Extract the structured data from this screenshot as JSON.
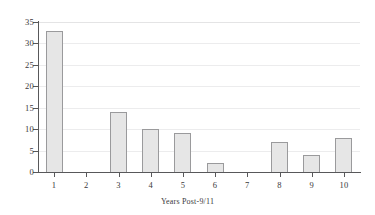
{
  "chart_data": {
    "type": "bar",
    "title": "",
    "subtitle": "",
    "xlabel": "Years Post-9/11",
    "ylabel": "",
    "categories": [
      "1",
      "2",
      "3",
      "4",
      "5",
      "6",
      "7",
      "8",
      "9",
      "10"
    ],
    "values": [
      33,
      0,
      14,
      10,
      9,
      2,
      0,
      7,
      4,
      8
    ],
    "series": [
      {
        "name": "count",
        "values": [
          33,
          0,
          14,
          10,
          9,
          2,
          0,
          7,
          4,
          8
        ]
      }
    ],
    "ylim": [
      0,
      35
    ],
    "yticks": [
      0,
      5,
      10,
      15,
      20,
      25,
      30,
      35
    ],
    "ytick_labels": [
      "0",
      "5",
      "10",
      "15",
      "20",
      "25",
      "30",
      "35"
    ],
    "xtick_labels": [
      "1",
      "2",
      "3",
      "4",
      "5",
      "6",
      "7",
      "8",
      "9",
      "10"
    ],
    "grid": "horizontal",
    "legend": "none",
    "colors": {
      "bar_fill": "#e6e6e6",
      "bar_border": "#9a9a9c",
      "gridline": "#ececed",
      "axis": "#58585a",
      "text": "#39393b",
      "background": "#ffffff"
    }
  }
}
